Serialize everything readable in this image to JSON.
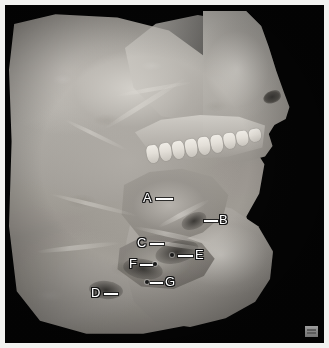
{
  "figure": {
    "kind": "anatomical-dissection-photograph",
    "view": "sagittal section of the head and neck, left lateral view",
    "background_color": "#050505",
    "margin_color": "#f2f2f0",
    "width": 329,
    "height": 348
  },
  "labels": [
    {
      "id": "A",
      "text": "A",
      "x": 138,
      "y": 186,
      "leader": {
        "x": 151,
        "y": 193,
        "length": 17,
        "direction": "right"
      },
      "dot": null
    },
    {
      "id": "B",
      "text": "B",
      "x": 214,
      "y": 208,
      "leader": {
        "x": 199,
        "y": 215,
        "length": 14,
        "direction": "left"
      },
      "dot": null
    },
    {
      "id": "C",
      "text": "C",
      "x": 132,
      "y": 231,
      "leader": {
        "x": 145,
        "y": 238,
        "length": 14,
        "direction": "right"
      },
      "dot": null
    },
    {
      "id": "D",
      "text": "D",
      "x": 86,
      "y": 281,
      "leader": {
        "x": 99,
        "y": 288,
        "length": 14,
        "direction": "right"
      },
      "dot": null
    },
    {
      "id": "E",
      "text": "E",
      "x": 190,
      "y": 243,
      "leader": {
        "x": 173,
        "y": 250,
        "length": 15,
        "direction": "left"
      },
      "dot": {
        "x": 165,
        "y": 248
      }
    },
    {
      "id": "F",
      "text": "F",
      "x": 124,
      "y": 252,
      "leader": {
        "x": 135,
        "y": 259,
        "length": 13,
        "direction": "right"
      },
      "dot": {
        "x": 148,
        "y": 257
      }
    },
    {
      "id": "G",
      "text": "G",
      "x": 160,
      "y": 270,
      "leader": {
        "x": 145,
        "y": 277,
        "length": 13,
        "direction": "left"
      },
      "dot": {
        "x": 140,
        "y": 275
      }
    }
  ],
  "teeth": {
    "count": 9,
    "spacing": 13
  },
  "watermark": {
    "name": "corner-watermark-badge",
    "visible": true
  }
}
